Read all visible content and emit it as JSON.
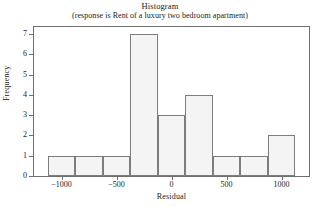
{
  "chart_data": {
    "type": "bar",
    "title": "Histogram",
    "subtitle": "(response is Rent of a luxury two bedroom apartment)",
    "xlabel": "Residual",
    "ylabel": "Frequency",
    "bin_width": 250,
    "bin_starts": [
      -1125,
      -875,
      -625,
      -375,
      -125,
      125,
      375,
      625,
      875
    ],
    "bin_ends": [
      -875,
      -625,
      -375,
      -125,
      125,
      375,
      625,
      875,
      1125
    ],
    "categories": [
      "-1125 to -875",
      "-875 to -625",
      "-625 to -375",
      "-375 to -125",
      "-125 to 125",
      "125 to 375",
      "375 to 625",
      "625 to 875",
      "875 to 1125"
    ],
    "values": [
      1,
      1,
      1,
      7,
      3,
      4,
      1,
      1,
      2
    ],
    "total_count": 21,
    "xlim": [
      -1250,
      1250
    ],
    "ylim": [
      0,
      7.35
    ],
    "xticks": [
      -1000,
      -500,
      0,
      500,
      1000
    ],
    "xtick_labels": [
      "−1000",
      "−500",
      "0",
      "500",
      "1000"
    ],
    "yticks": [
      0,
      1,
      2,
      3,
      4,
      5,
      6,
      7
    ],
    "ytick_labels": [
      "0",
      "1",
      "2",
      "3",
      "4",
      "5",
      "6",
      "7"
    ],
    "grid": false,
    "legend": false,
    "bar_fill_color": "#f4f4f4",
    "bar_border_color": "#7d7d7d",
    "axis_color": "#6f6f6f",
    "background_color": "#ffffff"
  }
}
